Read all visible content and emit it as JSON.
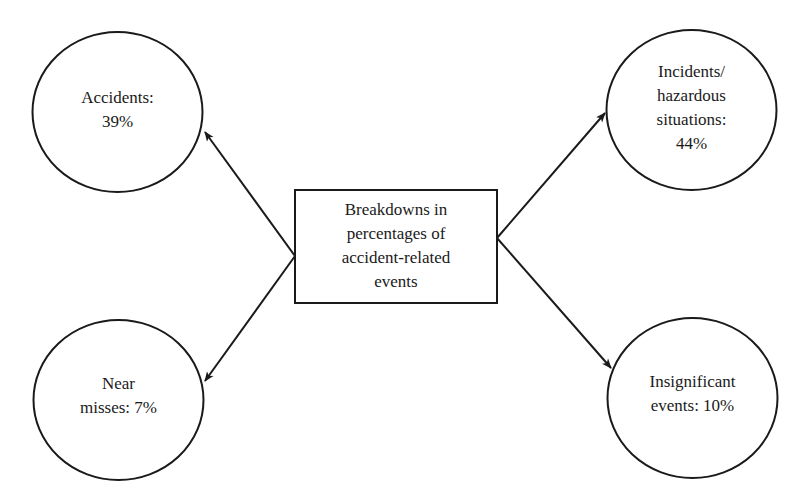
{
  "diagram": {
    "type": "hub-and-spoke",
    "center": {
      "lines": [
        "Breakdowns in",
        "percentages of",
        "accident-related",
        "events"
      ]
    },
    "nodes": [
      {
        "id": "accidents",
        "position": "top-left",
        "lines": [
          "Accidents:",
          "39%"
        ],
        "label": "Accidents",
        "percent": 39
      },
      {
        "id": "incidents-hazardous-situations",
        "position": "top-right",
        "lines": [
          "Incidents/",
          "hazardous",
          "situations:",
          "44%"
        ],
        "label": "Incidents/hazardous situations",
        "percent": 44
      },
      {
        "id": "near-misses",
        "position": "bottom-left",
        "lines": [
          "Near",
          "misses: 7%"
        ],
        "label": "Near misses",
        "percent": 7
      },
      {
        "id": "insignificant-events",
        "position": "bottom-right",
        "lines": [
          "Insignificant",
          "events: 10%"
        ],
        "label": "Insignificant events",
        "percent": 10
      }
    ],
    "edges": [
      {
        "from": "center",
        "to": "accidents",
        "arrow": "end"
      },
      {
        "from": "center",
        "to": "incidents-hazardous-situations",
        "arrow": "end"
      },
      {
        "from": "center",
        "to": "near-misses",
        "arrow": "end"
      },
      {
        "from": "center",
        "to": "insignificant-events",
        "arrow": "end"
      }
    ],
    "colors": {
      "stroke": "#1a1a1a",
      "background": "#ffffff",
      "text": "#1a1a1a"
    }
  }
}
